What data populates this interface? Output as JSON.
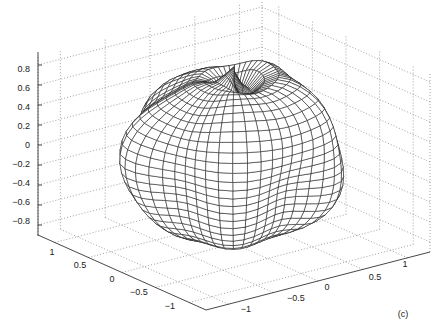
{
  "chart_data": {
    "type": "surface3d",
    "title": "",
    "panel_label": "(c)",
    "xlabel": "",
    "ylabel": "",
    "zlabel": "",
    "x_axis": {
      "ticks": [
        -1,
        -0.5,
        0,
        0.5,
        1
      ],
      "tick_labels": [
        "−1",
        "−0.5",
        "0",
        "0.5",
        "1"
      ],
      "range": [
        -1.25,
        1.25
      ]
    },
    "y_axis": {
      "ticks": [
        1,
        0.5,
        0,
        -0.5,
        -1
      ],
      "tick_labels": [
        "1",
        "0.5",
        "0",
        "−0.5",
        "−1"
      ],
      "range": [
        -1.25,
        1.25
      ]
    },
    "z_axis": {
      "ticks": [
        0.8,
        0.6,
        0.4,
        0.2,
        0,
        -0.2,
        -0.4,
        -0.6,
        -0.8
      ],
      "tick_labels": [
        "0.8",
        "0.6",
        "0.4",
        "0.2",
        "0",
        "−0.2",
        "−0.4",
        "−0.6",
        "−0.8"
      ],
      "range": [
        -0.9,
        0.9
      ]
    },
    "grid": true,
    "box": "dotted back panes",
    "colors": {
      "mesh": "#1a1a1a",
      "grid": "#8a8a8a",
      "axis": "#333333",
      "background": "#ffffff"
    }
  },
  "labels": {
    "z_ticks": [
      "0.8",
      "0.6",
      "0.4",
      "0.2",
      "0",
      "−0.2",
      "−0.4",
      "−0.6",
      "−0.8"
    ],
    "left_ticks": [
      "1",
      "0.5",
      "0",
      "−0.5",
      "−1"
    ],
    "right_ticks": [
      "−1",
      "−0.5",
      "0",
      "0.5",
      "1"
    ],
    "panel": "(c)"
  }
}
